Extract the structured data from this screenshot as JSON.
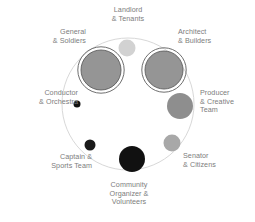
{
  "figure": {
    "type": "bubble-diagram",
    "outer_circle": {
      "stroke": "#d8d8d8",
      "fill": "#ffffff"
    },
    "axes": {
      "stroke": "#e8e8e8",
      "visible": true
    }
  },
  "labels": {
    "landlord": "Landlord\n& Tenants",
    "general": "General\n& Soldiers",
    "architect": "Architect\n& Builders",
    "conductor": "Conductor\n& Orchestra",
    "producer": "Producer\n& Creative\nTeam",
    "captain": "Captain &\nSports Team",
    "senator": "Senator\n& Citizens",
    "community": "Community\nOrganizer &\nVolunteers"
  },
  "chart_data": {
    "type": "scatter",
    "title": "",
    "xlabel": "",
    "ylabel": "",
    "legend": [],
    "grid": false,
    "nodes": [
      {
        "name": "Landlord & Tenants",
        "cx": 127,
        "cy": 48,
        "r": 8.5,
        "color": "#d2d2d2",
        "ring": false
      },
      {
        "name": "General & Soldiers",
        "cx": 101,
        "cy": 70,
        "r": 20.0,
        "color": "#959595",
        "ring": true,
        "ring_color": "#5d5d5d",
        "ring_gap": 3.2
      },
      {
        "name": "Architect & Builders",
        "cx": 164,
        "cy": 70,
        "r": 19.0,
        "color": "#959595",
        "ring": true,
        "ring_color": "#5d5d5d",
        "ring_gap": 3.2
      },
      {
        "name": "Producer & Creative Team",
        "cx": 180,
        "cy": 106,
        "r": 13.0,
        "color": "#8e8e8e",
        "ring": false
      },
      {
        "name": "Senator & Citizens",
        "cx": 172,
        "cy": 143,
        "r": 8.5,
        "color": "#a8a8a8",
        "ring": false
      },
      {
        "name": "Community Organizer & Volunteers",
        "cx": 132,
        "cy": 159,
        "r": 13.0,
        "color": "#111111",
        "ring": false
      },
      {
        "name": "Captain & Sports Team",
        "cx": 90,
        "cy": 145,
        "r": 5.5,
        "color": "#1a1a1a",
        "ring": false
      },
      {
        "name": "Conductor & Orchestra",
        "cx": 77,
        "cy": 104,
        "r": 3.5,
        "color": "#111111",
        "ring": false
      }
    ],
    "xlim": [
      0,
      255
    ],
    "ylim": [
      0,
      222
    ]
  }
}
